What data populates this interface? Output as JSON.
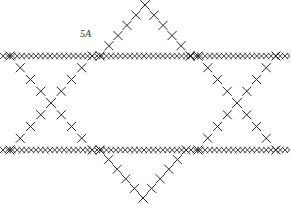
{
  "figure": {
    "label": "5A",
    "label_pos": {
      "x": 80,
      "y": 28
    },
    "stitch_color": "#2a2a2a",
    "background": "#ffffff",
    "horizontal_rows": [
      {
        "y": 56,
        "x1": 3,
        "x2": 285,
        "spacing": 9.4,
        "size": 3.2
      },
      {
        "y": 150,
        "x1": 3,
        "x2": 285,
        "spacing": 9.4,
        "size": 3.2
      }
    ],
    "diagonal_edges": [
      {
        "from": [
          145,
          5
        ],
        "to": [
          100,
          56
        ],
        "steps": 5
      },
      {
        "from": [
          145,
          5
        ],
        "to": [
          190,
          56
        ],
        "steps": 5
      },
      {
        "from": [
          10,
          56
        ],
        "to": [
          51,
          103
        ],
        "steps": 4
      },
      {
        "from": [
          51,
          103
        ],
        "to": [
          92,
          150
        ],
        "steps": 4
      },
      {
        "from": [
          92,
          56
        ],
        "to": [
          51,
          103
        ],
        "steps": 4
      },
      {
        "from": [
          51,
          103
        ],
        "to": [
          10,
          150
        ],
        "steps": 4
      },
      {
        "from": [
          198,
          56
        ],
        "to": [
          237,
          103
        ],
        "steps": 4
      },
      {
        "from": [
          237,
          103
        ],
        "to": [
          276,
          150
        ],
        "steps": 4
      },
      {
        "from": [
          276,
          56
        ],
        "to": [
          237,
          103
        ],
        "steps": 4
      },
      {
        "from": [
          237,
          103
        ],
        "to": [
          198,
          150
        ],
        "steps": 4
      },
      {
        "from": [
          100,
          150
        ],
        "to": [
          143,
          198
        ],
        "steps": 5
      },
      {
        "from": [
          186,
          150
        ],
        "to": [
          143,
          198
        ],
        "steps": 5
      }
    ],
    "diagonal_size": 4.5
  }
}
